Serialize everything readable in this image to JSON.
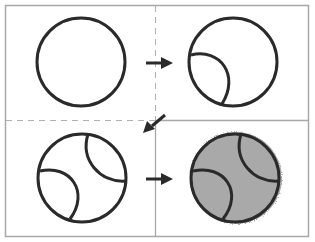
{
  "diagram": {
    "colors": {
      "background": "#ffffff",
      "frame": "#a8a8a8",
      "stroke": "#2a2a2a",
      "fill_shaded": "#a9a9a9",
      "arrow": "#2a2a2a"
    },
    "panels": [
      {
        "step": 1,
        "content": "plain circle"
      },
      {
        "step": 2,
        "content": "circle with one curved seam at lower-left"
      },
      {
        "step": 3,
        "content": "circle with two curved seams (lower-left and upper-right)"
      },
      {
        "step": 4,
        "content": "circle with two seams, shaded grey"
      }
    ],
    "arrows": [
      {
        "from": 1,
        "to": 2,
        "direction": "right"
      },
      {
        "from": 2,
        "to": 3,
        "direction": "down-left"
      },
      {
        "from": 3,
        "to": 4,
        "direction": "right"
      }
    ]
  }
}
